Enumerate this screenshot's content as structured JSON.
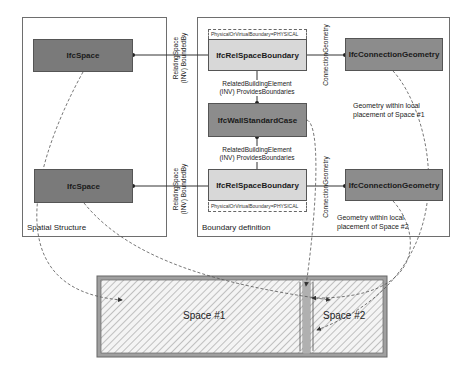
{
  "containers": {
    "spatial": {
      "label": "Spatial Structure"
    },
    "boundary": {
      "label": "Boundary definition"
    }
  },
  "nodes": {
    "space_top": "IfcSpace",
    "space_bottom": "IfcSpace",
    "rsb_top": "IfcRelSpaceBoundary",
    "rsb_bottom": "IfcRelSpaceBoundary",
    "wall": "IfcWallStandardCase",
    "cg_top": "IfcConnectionGeometry",
    "cg_bottom": "IfcConnectionGeometry"
  },
  "tags": {
    "rsb_top_attr": "PhysicalOrVirtualBoundary=PHYSICAL",
    "rsb_bottom_attr": "PhysicalOrVirtualBoundary=PHYSICAL"
  },
  "edge_labels": {
    "relating_space_top": [
      "RelatingSpace",
      "(INV) BoundedBy"
    ],
    "relating_space_bottom": [
      "RelatingSpace",
      "(INV) BoundedBy"
    ],
    "related_element_top": [
      "RelatedBuildingElement",
      "(INV) ProvidesBoundaries"
    ],
    "related_element_bottom": [
      "RelatedBuildingElement",
      "(INV) ProvidesBoundaries"
    ],
    "connection_geometry_top": "ConnectionGeometry",
    "connection_geometry_bottom": "ConnectionGeometry"
  },
  "notes": {
    "geometry_space1": [
      "Geometry within local",
      "placement of Space #1"
    ],
    "geometry_space2": [
      "Geometry within local",
      "placement of Space #2"
    ]
  },
  "floorplan": {
    "space1_label": "Space #1",
    "space2_label": "Space #2"
  },
  "colors": {
    "dark_node": "#7a7a7a",
    "light_node": "#d8d8d8",
    "wall_fill": "#a0a0a0",
    "border": "#555555"
  }
}
